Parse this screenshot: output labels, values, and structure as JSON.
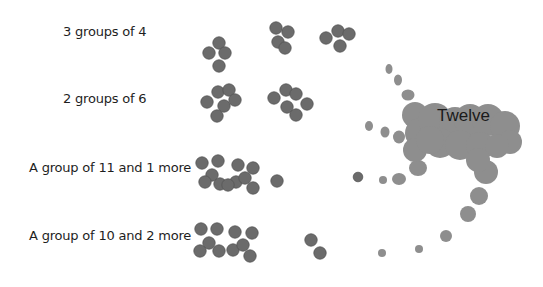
{
  "rows": [
    {
      "label": "3 groups of 4",
      "groups": [
        4,
        4,
        4
      ]
    },
    {
      "label": "2 groups of 6",
      "groups": [
        6,
        6
      ]
    },
    {
      "label": "A group of 11 and 1 more",
      "groups": [
        11,
        1
      ]
    },
    {
      "label": "A group of 10 and 2 more",
      "groups": [
        10,
        2
      ]
    }
  ],
  "merged_label": "Twelve",
  "colors": {
    "dot": "#6b6b6b",
    "dot_stroke": "#555555",
    "blob": "#8e8e8e"
  }
}
